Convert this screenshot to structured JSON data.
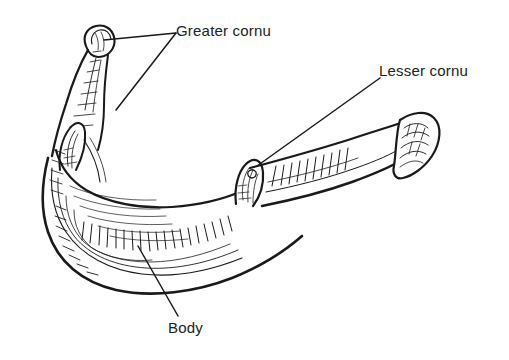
{
  "figure": {
    "kind": "anatomical-line-drawing",
    "view": "oblique superior view",
    "style": "black ink line art with hatching on white background",
    "background_color": "#ffffff",
    "ink_color": "#1a1a1a",
    "text_color": "#222222"
  },
  "labels": {
    "greater_cornu": "Greater cornu",
    "lesser_cornu": "Lesser cornu",
    "body": "Body"
  },
  "leader_lines": [
    {
      "label": "Greater cornu",
      "target": "left greater cornu tip",
      "from_x": 176,
      "from_y": 33,
      "to_x": 104,
      "to_y": 40
    },
    {
      "label": "Greater cornu",
      "target": "left greater cornu shaft",
      "from_x": 176,
      "from_y": 33,
      "to_x": 116,
      "to_y": 110
    },
    {
      "label": "Lesser cornu",
      "target": "lesser cornu process",
      "from_x": 380,
      "from_y": 78,
      "to_x": 257,
      "to_y": 166
    },
    {
      "label": "Body",
      "target": "body of hyoid",
      "from_x": 178,
      "from_y": 316,
      "to_x": 138,
      "to_y": 246
    }
  ],
  "parts": [
    {
      "name": "Greater cornu",
      "count": 2,
      "description": "long horn-like projections extending posteriorly from each side of the body"
    },
    {
      "name": "Lesser cornu",
      "count": 2,
      "description": "small conical processes projecting superiorly at the junction of body and greater cornu"
    },
    {
      "name": "Body",
      "count": 1,
      "description": "central curved quadrilateral portion of the bone"
    }
  ]
}
